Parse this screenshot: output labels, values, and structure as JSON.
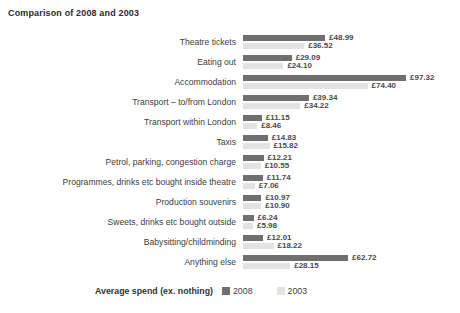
{
  "chart_data": {
    "type": "bar",
    "orientation": "horizontal",
    "title": "Comparison of 2008 and 2003",
    "legend_title": "Average spend (ex. nothing)",
    "legend_position": "bottom",
    "grid": false,
    "currency": "GBP",
    "xlim": [
      0,
      100
    ],
    "categories": [
      "Theatre tickets",
      "Eating out",
      "Accommodation",
      "Transport – to/from London",
      "Transport within London",
      "Taxis",
      "Petrol, parking, congestion charge",
      "Programmes, drinks etc bought inside theatre",
      "Production souvenirs",
      "Sweets, drinks etc bought outside",
      "Babysitting/childminding",
      "Anything else"
    ],
    "series": [
      {
        "name": "2008",
        "color": "#6f6f6f",
        "values": [
          48.99,
          29.09,
          97.32,
          39.34,
          11.15,
          14.83,
          12.21,
          11.74,
          10.97,
          6.24,
          12.01,
          62.72
        ]
      },
      {
        "name": "2003",
        "color": "#e3e3e2",
        "values": [
          36.52,
          24.1,
          74.4,
          34.22,
          8.46,
          15.82,
          10.55,
          7.06,
          10.9,
          5.98,
          18.22,
          28.15
        ]
      }
    ],
    "value_labels": [
      [
        "£48.99",
        "£36.52"
      ],
      [
        "£29.09",
        "£24.10"
      ],
      [
        "£97.32",
        "£74.40"
      ],
      [
        "£39.34",
        "£34.22"
      ],
      [
        "£11.15",
        "£8.46"
      ],
      [
        "£14.83",
        "£15.82"
      ],
      [
        "£12.21",
        "£10.55"
      ],
      [
        "£11.74",
        "£7.06"
      ],
      [
        "£10.97",
        "£10.90"
      ],
      [
        "£6.24",
        "£5.98"
      ],
      [
        "£12.01",
        "£18.22"
      ],
      [
        "£62.72",
        "£28.15"
      ]
    ]
  }
}
